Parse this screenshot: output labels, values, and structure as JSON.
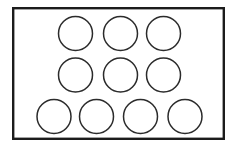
{
  "figure": {
    "title": "",
    "canvas": {
      "width": 237,
      "height": 147,
      "background": "#ffffff"
    },
    "container": {
      "name": "tray-outline",
      "shape": "rectangle",
      "x": 12,
      "y": 7,
      "width": 213,
      "height": 133,
      "stroke": "#1c1c1c",
      "stroke_width": 2.4,
      "fill": "#ffffff"
    },
    "circle_style": {
      "stroke": "#2b2b2b",
      "stroke_width": 1.5,
      "fill": "#ffffff",
      "radius": 17
    },
    "rows": [
      {
        "name": "row-top",
        "count": 3,
        "cy": 33.5,
        "circles": [
          {
            "label": "circle-r1-c1",
            "cx": 75.5,
            "cy": 33.5,
            "r": 17
          },
          {
            "label": "circle-r1-c2",
            "cx": 120.5,
            "cy": 33.5,
            "r": 17
          },
          {
            "label": "circle-r1-c3",
            "cx": 163.5,
            "cy": 33.5,
            "r": 17
          }
        ]
      },
      {
        "name": "row-middle",
        "count": 3,
        "cy": 75,
        "circles": [
          {
            "label": "circle-r2-c1",
            "cx": 75.5,
            "cy": 75,
            "r": 17
          },
          {
            "label": "circle-r2-c2",
            "cx": 120.5,
            "cy": 75,
            "r": 17
          },
          {
            "label": "circle-r2-c3",
            "cx": 163.5,
            "cy": 75,
            "r": 17
          }
        ]
      },
      {
        "name": "row-bottom",
        "count": 4,
        "cy": 116.5,
        "circles": [
          {
            "label": "circle-r3-c1",
            "cx": 54,
            "cy": 116.5,
            "r": 17
          },
          {
            "label": "circle-r3-c2",
            "cx": 96.5,
            "cy": 116.5,
            "r": 17
          },
          {
            "label": "circle-r3-c3",
            "cx": 140.5,
            "cy": 116.5,
            "r": 17
          },
          {
            "label": "circle-r3-c4",
            "cx": 185,
            "cy": 116.5,
            "r": 17
          }
        ]
      }
    ],
    "total_circles": 10
  }
}
